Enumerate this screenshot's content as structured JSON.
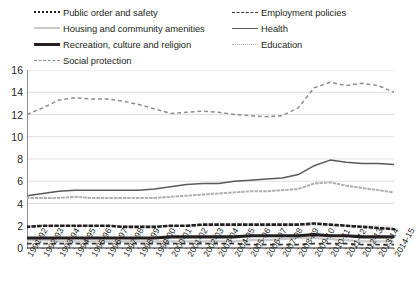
{
  "legend": {
    "entries": [
      {
        "label": "Public order and safety",
        "style": "dotted",
        "col": 0,
        "row": 0
      },
      {
        "label": "Housing and community amenities",
        "style": "solid-lt",
        "col": 0,
        "row": 1
      },
      {
        "label": "Recreation, culture and religion",
        "style": "solid-thick",
        "col": 0,
        "row": 2
      },
      {
        "label": "Social protection",
        "style": "dashed-gray",
        "col": 0,
        "row": 3
      },
      {
        "label": "Employment policies",
        "style": "dashed-dark",
        "col": 1,
        "row": 0
      },
      {
        "label": "Health",
        "style": "solid-med",
        "col": 1,
        "row": 1
      },
      {
        "label": "Education",
        "style": "dotted-lt",
        "col": 1,
        "row": 2
      }
    ]
  },
  "chart_data": {
    "type": "line",
    "title": "",
    "xlabel": "",
    "ylabel": "",
    "ylim": [
      0,
      16
    ],
    "yticks": [
      0,
      2,
      4,
      6,
      8,
      10,
      12,
      14,
      16
    ],
    "grid": true,
    "legend_position": "top",
    "categories": [
      "1991-92",
      "1992-93",
      "1993-94",
      "1994-95",
      "1995-96",
      "1996-97",
      "1997-98",
      "1998-99",
      "1999-00",
      "2000-01",
      "2001-02",
      "2002-03",
      "2003-04",
      "2004-05",
      "2005-06",
      "2006-07",
      "2007-08",
      "2008-09",
      "2009-10",
      "2010-11",
      "2011-12",
      "2012-13",
      "2013-14",
      "2014-15"
    ],
    "series": [
      {
        "name": "Social protection",
        "color": "#8d8d8d",
        "style": "dashed",
        "width": 1.5,
        "values": [
          12.0,
          12.6,
          13.3,
          13.5,
          13.4,
          13.4,
          13.2,
          12.9,
          12.5,
          12.1,
          12.2,
          12.3,
          12.2,
          12.0,
          11.9,
          11.8,
          11.9,
          12.6,
          14.4,
          14.9,
          14.6,
          14.8,
          14.6,
          14.0
        ]
      },
      {
        "name": "Health",
        "color": "#5a5a5a",
        "style": "solid",
        "width": 1.5,
        "values": [
          4.7,
          4.9,
          5.1,
          5.2,
          5.2,
          5.2,
          5.2,
          5.2,
          5.3,
          5.5,
          5.7,
          5.8,
          5.8,
          6.0,
          6.1,
          6.2,
          6.3,
          6.6,
          7.4,
          7.9,
          7.7,
          7.6,
          7.6,
          7.5
        ]
      },
      {
        "name": "Education",
        "color": "#b0b0b0",
        "style": "dotted",
        "width": 2.0,
        "values": [
          4.5,
          4.5,
          4.5,
          4.6,
          4.5,
          4.5,
          4.5,
          4.5,
          4.5,
          4.6,
          4.7,
          4.8,
          4.9,
          5.0,
          5.1,
          5.1,
          5.2,
          5.3,
          5.8,
          5.9,
          5.6,
          5.4,
          5.2,
          5.0
        ]
      },
      {
        "name": "Public order and safety",
        "color": "#231f20",
        "style": "dotted",
        "width": 2.6,
        "values": [
          1.9,
          2.0,
          2.0,
          2.0,
          2.0,
          2.0,
          1.9,
          1.9,
          1.9,
          2.0,
          2.0,
          2.1,
          2.1,
          2.1,
          2.1,
          2.1,
          2.1,
          2.1,
          2.2,
          2.1,
          2.0,
          1.9,
          1.8,
          1.7
        ]
      },
      {
        "name": "Recreation, culture and religion",
        "color": "#231f20",
        "style": "solid",
        "width": 3.2,
        "values": [
          0.9,
          0.9,
          0.9,
          0.9,
          0.9,
          0.9,
          0.9,
          0.9,
          0.9,
          1.0,
          1.0,
          1.0,
          1.0,
          1.0,
          1.1,
          1.1,
          1.1,
          1.1,
          1.2,
          1.1,
          1.1,
          1.0,
          1.0,
          1.0
        ]
      },
      {
        "name": "Housing and community amenities",
        "color": "#c9c9c9",
        "style": "solid",
        "width": 2.2,
        "values": [
          0.7,
          0.7,
          0.6,
          0.6,
          0.6,
          0.6,
          0.6,
          0.6,
          0.6,
          0.6,
          0.6,
          0.6,
          0.6,
          0.6,
          0.7,
          0.7,
          0.8,
          0.9,
          0.9,
          0.8,
          0.7,
          0.6,
          0.6,
          0.6
        ]
      },
      {
        "name": "Employment policies",
        "color": "#3a3a3a",
        "style": "dashed",
        "width": 1.8,
        "values": [
          0.4,
          0.4,
          0.4,
          0.4,
          0.4,
          0.4,
          0.4,
          0.4,
          0.4,
          0.4,
          0.4,
          0.4,
          0.4,
          0.4,
          0.3,
          0.3,
          0.3,
          0.3,
          0.4,
          0.4,
          0.4,
          0.3,
          0.3,
          0.3
        ]
      }
    ]
  }
}
